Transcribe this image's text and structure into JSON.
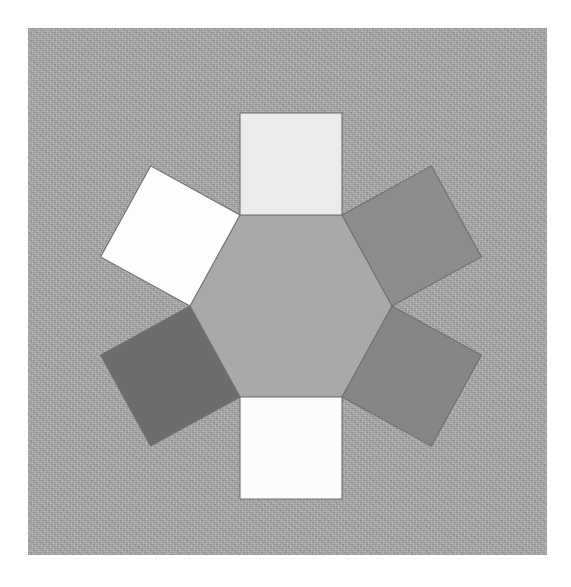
{
  "figure": {
    "kind": "geometry-figure",
    "caption": "",
    "page_background": "#ffffff",
    "panel": {
      "background_color": "#a9a9a9",
      "texture": "paper-grain-noise",
      "x": 28,
      "y": 28,
      "width": 519,
      "height": 527
    },
    "net": {
      "description": "hexagonal prism net fragment: regular hexagon with six square faces hinged on its edges",
      "center": {
        "x": 263,
        "y": 278
      },
      "hexagon": {
        "name": "central-hexagon",
        "circumradius": 105,
        "rotation_deg": 30,
        "fill": "#a9a9a9",
        "stroke": "#8e8e8e",
        "vertices": [
          {
            "x": 212,
            "y": 187
          },
          {
            "x": 314,
            "y": 187
          },
          {
            "x": 364,
            "y": 278
          },
          {
            "x": 314,
            "y": 369
          },
          {
            "x": 212,
            "y": 369
          },
          {
            "x": 162,
            "y": 278
          }
        ]
      },
      "squares": [
        {
          "name": "square-top",
          "position": "top",
          "fill": "#ebebeb",
          "edge_index": 0,
          "shade_label": "very light gray"
        },
        {
          "name": "square-upper-right",
          "position": "upper-right",
          "fill": "#8d8d8d",
          "edge_index": 1,
          "shade_label": "medium gray"
        },
        {
          "name": "square-lower-right",
          "position": "lower-right",
          "fill": "#868686",
          "edge_index": 2,
          "shade_label": "medium gray"
        },
        {
          "name": "square-bottom",
          "position": "bottom",
          "fill": "#fcfcfc",
          "edge_index": 3,
          "shade_label": "white"
        },
        {
          "name": "square-lower-left",
          "position": "lower-left",
          "fill": "#6d6d6d",
          "edge_index": 4,
          "shade_label": "dark gray"
        },
        {
          "name": "square-upper-left",
          "position": "upper-left",
          "fill": "#fdfdfd",
          "edge_index": 5,
          "shade_label": "white"
        }
      ],
      "square_side": 102,
      "face_stroke": "#6f6f6f",
      "face_count": 6
    }
  }
}
